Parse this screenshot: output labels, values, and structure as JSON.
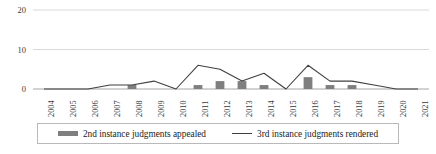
{
  "chart_data": {
    "type": "bar",
    "title": "",
    "subtitle": "",
    "xlabel": "",
    "ylabel": "",
    "categories": [
      "2004",
      "2005",
      "2006",
      "2007",
      "2008",
      "2009",
      "2010",
      "2011",
      "2012",
      "2013",
      "2014",
      "2015",
      "2016",
      "2017",
      "2018",
      "2019",
      "2020",
      "2021"
    ],
    "series": [
      {
        "name": "2nd instance judgments appealed",
        "type": "bar",
        "color": "#7f7f7f",
        "values": [
          0,
          0,
          0,
          0,
          1,
          0,
          0,
          1,
          2,
          2,
          1,
          0,
          3,
          1,
          1,
          0,
          0,
          0
        ]
      },
      {
        "name": "3rd instance judgments rendered",
        "type": "line",
        "color": "#3f3f3f",
        "values": [
          0,
          0,
          0,
          1,
          1,
          2,
          0,
          6,
          5,
          2,
          4,
          0,
          6,
          2,
          2,
          1,
          0,
          0
        ]
      }
    ],
    "ylim": [
      0,
      20
    ],
    "yticks": [
      0,
      10,
      20
    ],
    "ytick_labels": [
      "0",
      "10",
      "20"
    ],
    "grid": true,
    "grid_axis": "y",
    "legend_position": "bottom"
  },
  "axes": {
    "y": {
      "ticks": [
        {
          "label": "20",
          "value": 20
        },
        {
          "label": "10",
          "value": 10
        },
        {
          "label": "0",
          "value": 0
        }
      ]
    },
    "x": {
      "ticks": [
        {
          "label": "2004"
        },
        {
          "label": "2005"
        },
        {
          "label": "2006"
        },
        {
          "label": "2007"
        },
        {
          "label": "2008"
        },
        {
          "label": "2009"
        },
        {
          "label": "2010"
        },
        {
          "label": "2011"
        },
        {
          "label": "2012"
        },
        {
          "label": "2013"
        },
        {
          "label": "2014"
        },
        {
          "label": "2015"
        },
        {
          "label": "2016"
        },
        {
          "label": "2017"
        },
        {
          "label": "2018"
        },
        {
          "label": "2019"
        },
        {
          "label": "2020"
        },
        {
          "label": "2021"
        }
      ]
    }
  },
  "legend": {
    "items": [
      {
        "label": "2nd instance judgments appealed",
        "marker": "bar-swatch",
        "color": "#7f7f7f"
      },
      {
        "label": "3rd instance judgments rendered",
        "marker": "line-swatch",
        "color": "#3f3f3f"
      }
    ]
  },
  "colors": {
    "bar": "#7f7f7f",
    "line": "#3f3f3f",
    "grid": "#d9d9d9",
    "axis": "#a6a6a6",
    "text": "#262626",
    "background": "#ffffff"
  }
}
